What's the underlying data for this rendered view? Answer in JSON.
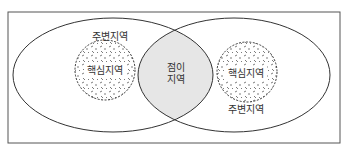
{
  "diagram": {
    "type": "overlapping-regions",
    "regions": {
      "left_periphery": {
        "label": "주변지역"
      },
      "left_core": {
        "label": "핵심지역"
      },
      "transition": {
        "label_line1": "점이",
        "label_line2": "지역"
      },
      "right_core": {
        "label": "핵심지역"
      },
      "right_periphery": {
        "label": "주변지역"
      }
    },
    "colors": {
      "stroke": "#333333",
      "overlap_fill": "#e6e6e6",
      "background": "#ffffff",
      "border": "#555555"
    }
  }
}
